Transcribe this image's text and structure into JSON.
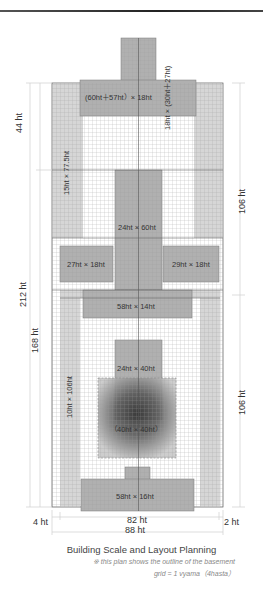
{
  "figure": {
    "title": "Building Scale and Layout Planning",
    "note": "※ this plan shows the outline of the basement",
    "grid_note": "grid = 1 vyama（4hasta）"
  },
  "dimensions": {
    "total_height": "212 ht",
    "lower_height": "168 ht",
    "upper_left": "44 ht",
    "right_upper": "106 ht",
    "right_lower": "106 ht",
    "inner_width": "82 ht",
    "total_width": "88 ht",
    "left_margin": "4 ht",
    "right_margin": "2 ht"
  },
  "blocks": {
    "top_crossbar": "(60ht＋57ht）× 18ht",
    "top_stem": "18ht × (30ht＋27ht)",
    "left_wing": "15ht × 77.5ht",
    "center_hall": "24ht × 60ht",
    "left_side": "27ht × 18ht",
    "right_side": "29ht × 18ht",
    "mid_bar": "58ht × 14ht",
    "left_strip": "10ht × 106ht",
    "inner_hall": "24ht × 40ht",
    "basement": "（40ht × 40ht）",
    "bottom_bar": "58ht × 16ht"
  },
  "colors": {
    "light_fill": "#d4d4d4",
    "mid_fill": "#b3b3b3",
    "grid_line": "#9a9a9a",
    "dim_line": "#cccccc"
  }
}
